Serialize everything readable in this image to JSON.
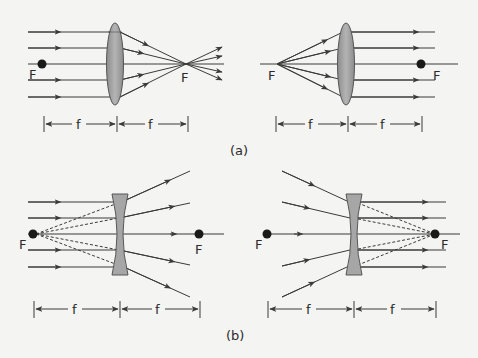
{
  "diagram": {
    "colors": {
      "background": "#f4f4f2",
      "ray": "#3a3a3a",
      "lens_fill": "#9e9e9e",
      "lens_stroke": "#555555",
      "focal_dot": "#1a1a1a",
      "text": "#2a2a2a"
    },
    "panels": [
      {
        "id": "a-left",
        "lens": "convex",
        "description": "Parallel rays converge to focal point F on right",
        "labels": {
          "focal_left": "F",
          "focal_right": "F",
          "dist1": "f",
          "dist2": "f"
        }
      },
      {
        "id": "a-right",
        "lens": "convex",
        "description": "Rays diverging from F on left emerge parallel",
        "labels": {
          "focal_left": "F",
          "focal_right": "F",
          "dist1": "f",
          "dist2": "f"
        }
      },
      {
        "id": "b-left",
        "lens": "concave",
        "description": "Parallel rays diverge as if from F on left",
        "labels": {
          "focal_left": "F",
          "focal_right": "F",
          "dist1": "f",
          "dist2": "f"
        }
      },
      {
        "id": "b-right",
        "lens": "concave",
        "description": "Rays converging toward F on right emerge parallel",
        "labels": {
          "focal_left": "F",
          "focal_right": "F",
          "dist1": "f",
          "dist2": "f"
        }
      }
    ],
    "captions": {
      "a": "(a)",
      "b": "(b)"
    }
  }
}
